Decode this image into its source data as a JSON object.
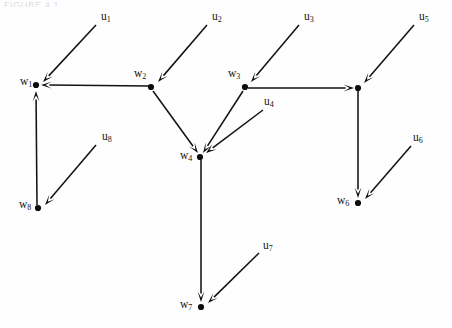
{
  "page": {
    "width": 452,
    "height": 328,
    "background": "#fefefe",
    "ink_color": "#0d0d0d",
    "cropped_header_text": "FIGURE 4.1"
  },
  "diagram": {
    "type": "directed-graph",
    "title": "",
    "nodes": [
      {
        "id": "w1",
        "label": "w",
        "subscript": "1",
        "x": 36,
        "y": 85,
        "label_x": 20,
        "label_y": 76,
        "labeled": true
      },
      {
        "id": "w2",
        "label": "w",
        "subscript": "2",
        "x": 151,
        "y": 87,
        "label_x": 134,
        "label_y": 68,
        "labeled": true
      },
      {
        "id": "w3",
        "label": "w",
        "subscript": "3",
        "x": 245,
        "y": 87,
        "label_x": 228,
        "label_y": 68,
        "labeled": true
      },
      {
        "id": "n5",
        "label": "",
        "subscript": "",
        "x": 358,
        "y": 88,
        "label_x": 0,
        "label_y": 0,
        "labeled": false
      },
      {
        "id": "w4",
        "label": "w",
        "subscript": "4",
        "x": 200,
        "y": 157,
        "label_x": 180,
        "label_y": 150,
        "labeled": true
      },
      {
        "id": "w8",
        "label": "w",
        "subscript": "8",
        "x": 38,
        "y": 208,
        "label_x": 19,
        "label_y": 199,
        "labeled": true
      },
      {
        "id": "w6",
        "label": "w",
        "subscript": "6",
        "x": 358,
        "y": 203,
        "label_x": 337,
        "label_y": 195,
        "labeled": true
      },
      {
        "id": "w7",
        "label": "w",
        "subscript": "7",
        "x": 201,
        "y": 307,
        "label_x": 180,
        "label_y": 299,
        "labeled": true
      }
    ],
    "input_labels": [
      {
        "id": "u1",
        "label": "u",
        "subscript": "1",
        "label_x": 101,
        "label_y": 11
      },
      {
        "id": "u2",
        "label": "u",
        "subscript": "2",
        "label_x": 212,
        "label_y": 11
      },
      {
        "id": "u3",
        "label": "u",
        "subscript": "3",
        "label_x": 304,
        "label_y": 11
      },
      {
        "id": "u4",
        "label": "u",
        "subscript": "4",
        "label_x": 264,
        "label_y": 96
      },
      {
        "id": "u5",
        "label": "u",
        "subscript": "5",
        "label_x": 419,
        "label_y": 11
      },
      {
        "id": "u6",
        "label": "u",
        "subscript": "6",
        "label_x": 413,
        "label_y": 132
      },
      {
        "id": "u7",
        "label": "u",
        "subscript": "7",
        "label_x": 263,
        "label_y": 240
      },
      {
        "id": "u8",
        "label": "u",
        "subscript": "8",
        "label_x": 102,
        "label_y": 131
      }
    ],
    "edges": [
      {
        "id": "e-u1-w1",
        "from": "u1",
        "to": "w1",
        "x1": 96,
        "y1": 25,
        "x2": 43,
        "y2": 82,
        "arrow": true
      },
      {
        "id": "e-u2-w2",
        "from": "u2",
        "to": "w2",
        "x1": 207,
        "y1": 25,
        "x2": 158,
        "y2": 82,
        "arrow": true
      },
      {
        "id": "e-u3-w3",
        "from": "u3",
        "to": "w3",
        "x1": 299,
        "y1": 25,
        "x2": 251,
        "y2": 82,
        "arrow": true
      },
      {
        "id": "e-u5-n5",
        "from": "u5",
        "to": "n5",
        "x1": 414,
        "y1": 25,
        "x2": 364,
        "y2": 83,
        "arrow": true
      },
      {
        "id": "e-u4-w4",
        "from": "u4",
        "to": "w4",
        "x1": 263,
        "y1": 110,
        "x2": 206,
        "y2": 153,
        "arrow": true
      },
      {
        "id": "e-u6-w6",
        "from": "u6",
        "to": "w6",
        "x1": 411,
        "y1": 146,
        "x2": 365,
        "y2": 199,
        "arrow": true
      },
      {
        "id": "e-u7-w7",
        "from": "u7",
        "to": "w7",
        "x1": 259,
        "y1": 253,
        "x2": 208,
        "y2": 303,
        "arrow": true
      },
      {
        "id": "e-u8-w8",
        "from": "u8",
        "to": "w8",
        "x1": 96,
        "y1": 145,
        "x2": 45,
        "y2": 205,
        "arrow": true
      },
      {
        "id": "e-w2-w1",
        "from": "w2",
        "to": "w1",
        "x1": 149,
        "y1": 86,
        "x2": 41,
        "y2": 85,
        "arrow": true
      },
      {
        "id": "e-w2-w4",
        "from": "w2",
        "to": "w4",
        "x1": 153,
        "y1": 91,
        "x2": 198,
        "y2": 153,
        "arrow": true
      },
      {
        "id": "e-w3-w4",
        "from": "w3",
        "to": "w4",
        "x1": 243,
        "y1": 91,
        "x2": 203,
        "y2": 153,
        "arrow": true
      },
      {
        "id": "e-w3-n5",
        "from": "w3",
        "to": "n5",
        "x1": 248,
        "y1": 88,
        "x2": 354,
        "y2": 88,
        "arrow": true
      },
      {
        "id": "e-n5-w6",
        "from": "n5",
        "to": "w6",
        "x1": 358,
        "y1": 91,
        "x2": 358,
        "y2": 198,
        "arrow": true
      },
      {
        "id": "e-w4-w7",
        "from": "w4",
        "to": "w7",
        "x1": 201,
        "y1": 160,
        "x2": 201,
        "y2": 302,
        "arrow": true
      },
      {
        "id": "e-w8-w1",
        "from": "w8",
        "to": "w1",
        "x1": 37,
        "y1": 205,
        "x2": 36,
        "y2": 91,
        "arrow": true
      }
    ]
  }
}
